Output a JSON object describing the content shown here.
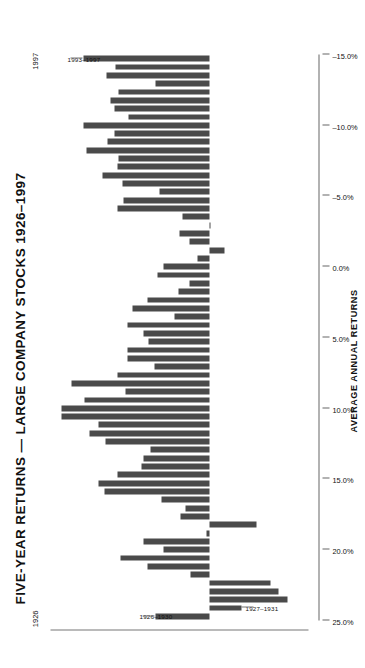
{
  "chart_data": {
    "type": "bar",
    "title": "FIVE-YEAR RETURNS — LARGE COMPANY STOCKS  1926–1997",
    "xlabel": "",
    "ylabel": "AVERAGE ANNUAL RETURNS",
    "orientation": "horizontal-rotated",
    "grid": false,
    "legend": null,
    "ylim": [
      -15.0,
      25.0
    ],
    "tick_labels": [
      "25.0%",
      "20.0%",
      "15.0%",
      "10.0%",
      "5.0%",
      "0.0%",
      "–5.0%",
      "–10.0%",
      "–15.0%"
    ],
    "tick_values": [
      25.0,
      20.0,
      15.0,
      10.0,
      5.0,
      0.0,
      -5.0,
      -10.0,
      -15.0
    ],
    "category_axis_endpoints": [
      "1926",
      "1997"
    ],
    "annotations": [
      {
        "label": "1993–1997",
        "category": "1993–1997"
      },
      {
        "label": "1926–1930",
        "category": "1926–1930"
      },
      {
        "label": "1927–1931",
        "category": "1927–1931"
      }
    ],
    "categories": [
      "1926–1930",
      "1927–1931",
      "1928–1932",
      "1929–1933",
      "1930–1934",
      "1931–1935",
      "1932–1936",
      "1933–1937",
      "1934–1938",
      "1935–1939",
      "1936–1940",
      "1937–1941",
      "1938–1942",
      "1939–1943",
      "1940–1944",
      "1941–1945",
      "1942–1946",
      "1943–1947",
      "1944–1948",
      "1945–1949",
      "1946–1950",
      "1947–1951",
      "1948–1952",
      "1949–1953",
      "1950–1954",
      "1951–1955",
      "1952–1956",
      "1953–1957",
      "1954–1958",
      "1955–1959",
      "1956–1960",
      "1957–1961",
      "1958–1962",
      "1959–1963",
      "1960–1964",
      "1961–1965",
      "1962–1966",
      "1963–1967",
      "1964–1968",
      "1965–1969",
      "1966–1970",
      "1967–1971",
      "1968–1972",
      "1969–1973",
      "1970–1974",
      "1971–1975",
      "1972–1976",
      "1973–1977",
      "1974–1978",
      "1975–1979",
      "1976–1980",
      "1977–1981",
      "1978–1982",
      "1979–1983",
      "1980–1984",
      "1981–1985",
      "1982–1986",
      "1983–1987",
      "1984–1988",
      "1985–1989",
      "1986–1990",
      "1987–1991",
      "1988–1992",
      "1989–1993",
      "1990–1994",
      "1991–1995",
      "1992–1996",
      "1993–1997"
    ],
    "values": [
      8.7,
      -5.1,
      -12.5,
      -11.2,
      -9.9,
      3.1,
      10.0,
      14.3,
      7.4,
      10.7,
      0.5,
      -7.5,
      4.6,
      3.8,
      7.7,
      16.9,
      17.9,
      14.8,
      10.9,
      10.7,
      9.5,
      16.7,
      19.4,
      17.9,
      23.9,
      23.9,
      20.2,
      13.6,
      22.3,
      14.9,
      8.9,
      13.3,
      13.3,
      9.9,
      10.7,
      13.2,
      5.7,
      12.4,
      10.0,
      5.0,
      3.3,
      8.4,
      7.5,
      2.0,
      -2.4,
      3.2,
      4.9,
      -0.2,
      4.3,
      14.8,
      13.9,
      8.1,
      14.1,
      17.3,
      14.8,
      14.7,
      19.9,
      16.5,
      15.4,
      20.4,
      13.1,
      15.4,
      15.9,
      14.6,
      8.7,
      16.6,
      15.2,
      20.3
    ]
  },
  "style": {
    "bar_color": "#4a4a4a",
    "axis_color": "#666666",
    "text_color": "#111111",
    "background": "#ffffff"
  }
}
